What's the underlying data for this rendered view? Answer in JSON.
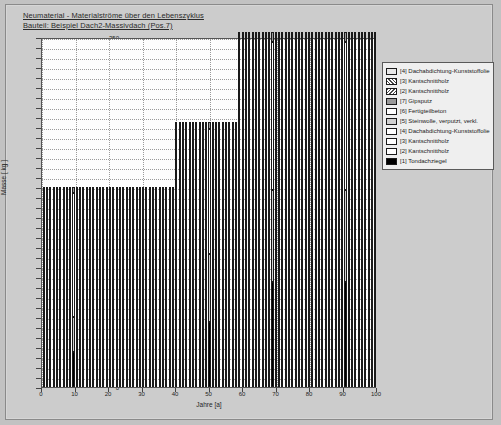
{
  "header": {
    "line1": "Neumaterial - Materialströme über den Lebenszyklus",
    "line2": "Bauteil: Beispiel Dach2-Massivdach (Pos.7)"
  },
  "chart_data": {
    "type": "bar",
    "title": "Neumaterial - Materialströme über den Lebenszyklus",
    "subtitle": "Bauteil: Beispiel Dach2-Massivdach (Pos.7)",
    "xlabel": "Jahre [a]",
    "ylabel": "Masse [ kg ]",
    "xlim": [
      0,
      100
    ],
    "ylim": [
      0,
      350
    ],
    "ytick_step": 10,
    "xtick_step": 10,
    "grid": true,
    "legend_position": "top-right-outside",
    "ytick_labels": [
      "0",
      "10",
      "20",
      "30",
      "40",
      "50",
      "60",
      "70",
      "80",
      "90",
      "100",
      "110",
      "120",
      "130",
      "140",
      "150",
      "160",
      "170",
      "180",
      "190",
      "200",
      "210",
      "220",
      "230",
      "240",
      "250",
      "260",
      "270",
      "280",
      "290",
      "300",
      "310",
      "320",
      "330",
      "340",
      "350"
    ],
    "xtick_labels": [
      "0",
      "10",
      "20",
      "30",
      "40",
      "50",
      "60",
      "70",
      "80",
      "90",
      "100"
    ],
    "legend": [
      {
        "label": "[4] Dachabdichtung-Kunststoffolie",
        "fill": "dots"
      },
      {
        "label": "[3] Kantschnittholz",
        "fill": "hatch-a"
      },
      {
        "label": "[2] Kantschnittholz",
        "fill": "hatch-b"
      },
      {
        "label": "[7] Gipsputz",
        "fill": "mdgray"
      },
      {
        "label": "[6] Fertigteilbeton",
        "fill": "white"
      },
      {
        "label": "[5] Steinwolle, verputzt, verkl.",
        "fill": "ltgray"
      },
      {
        "label": "[4] Dachabdichtung-Kunststoffolie",
        "fill": "white"
      },
      {
        "label": "[3] Kantschnittholz",
        "fill": "white"
      },
      {
        "label": "[2] Kantschnittholz",
        "fill": "white"
      },
      {
        "label": "[1] Tondachziegel",
        "fill": "black"
      }
    ],
    "series": [
      {
        "name": "[1] Tondachziegel",
        "fill": "black"
      },
      {
        "name": "[5] Steinwolle, verputzt, verkl.",
        "fill": "ltgray"
      },
      {
        "name": "[6] Fertigteilbeton",
        "fill": "white"
      },
      {
        "name": "[7] Gipsputz",
        "fill": "mdgray"
      }
    ],
    "groups": [
      {
        "name": "Phase 1 (Jahre 0-39)",
        "years_from": 0,
        "years_to": 39,
        "total": 200,
        "stack": [
          {
            "fill": "black",
            "from": 0,
            "to": 35
          },
          {
            "fill": "ltgray",
            "from": 35,
            "to": 70
          },
          {
            "fill": "white",
            "from": 70,
            "to": 194
          },
          {
            "fill": "mdgray",
            "from": 194,
            "to": 200
          }
        ]
      },
      {
        "name": "Phase 2 (Jahre 40-58)",
        "years_from": 40,
        "years_to": 58,
        "total": 265,
        "stack": [
          {
            "fill": "black",
            "from": 0,
            "to": 65
          },
          {
            "fill": "ltgray",
            "from": 65,
            "to": 133
          },
          {
            "fill": "white",
            "from": 133,
            "to": 258
          },
          {
            "fill": "mdgray",
            "from": 258,
            "to": 265
          }
        ]
      },
      {
        "name": "Phase 3 (Jahre 59-100)",
        "years_from": 59,
        "years_to": 100,
        "total": 355,
        "stack": [
          {
            "fill": "black",
            "from": 0,
            "to": 105
          },
          {
            "fill": "ltgray",
            "from": 105,
            "to": 197
          },
          {
            "fill": "white",
            "from": 197,
            "to": 345
          },
          {
            "fill": "mdgray",
            "from": 345,
            "to": 355
          }
        ]
      }
    ],
    "bars": [
      {
        "year": 0,
        "total": 200
      },
      {
        "year": 1,
        "total": 200
      },
      {
        "year": 2,
        "total": 200
      },
      {
        "year": 3,
        "total": 200
      },
      {
        "year": 4,
        "total": 200
      },
      {
        "year": 5,
        "total": 200
      },
      {
        "year": 6,
        "total": 200
      },
      {
        "year": 7,
        "total": 200
      },
      {
        "year": 8,
        "total": 200
      },
      {
        "year": 9,
        "total": 200
      },
      {
        "year": 10,
        "total": 200
      },
      {
        "year": 11,
        "total": 200
      },
      {
        "year": 12,
        "total": 200
      },
      {
        "year": 13,
        "total": 200
      },
      {
        "year": 14,
        "total": 200
      },
      {
        "year": 15,
        "total": 200
      },
      {
        "year": 16,
        "total": 200
      },
      {
        "year": 17,
        "total": 200
      },
      {
        "year": 18,
        "total": 200
      },
      {
        "year": 19,
        "total": 200
      },
      {
        "year": 20,
        "total": 200
      },
      {
        "year": 21,
        "total": 200
      },
      {
        "year": 22,
        "total": 200
      },
      {
        "year": 23,
        "total": 200
      },
      {
        "year": 24,
        "total": 200
      },
      {
        "year": 25,
        "total": 200
      },
      {
        "year": 26,
        "total": 200
      },
      {
        "year": 27,
        "total": 200
      },
      {
        "year": 28,
        "total": 200
      },
      {
        "year": 29,
        "total": 200
      },
      {
        "year": 30,
        "total": 200
      },
      {
        "year": 31,
        "total": 200
      },
      {
        "year": 32,
        "total": 200
      },
      {
        "year": 33,
        "total": 200
      },
      {
        "year": 34,
        "total": 200
      },
      {
        "year": 35,
        "total": 200
      },
      {
        "year": 36,
        "total": 200
      },
      {
        "year": 37,
        "total": 200
      },
      {
        "year": 38,
        "total": 200
      },
      {
        "year": 39,
        "total": 200
      },
      {
        "year": 40,
        "total": 265
      },
      {
        "year": 41,
        "total": 265
      },
      {
        "year": 42,
        "total": 265
      },
      {
        "year": 43,
        "total": 265
      },
      {
        "year": 44,
        "total": 265
      },
      {
        "year": 45,
        "total": 265
      },
      {
        "year": 46,
        "total": 265
      },
      {
        "year": 47,
        "total": 265
      },
      {
        "year": 48,
        "total": 265
      },
      {
        "year": 49,
        "total": 265
      },
      {
        "year": 50,
        "total": 265
      },
      {
        "year": 51,
        "total": 265
      },
      {
        "year": 52,
        "total": 265
      },
      {
        "year": 53,
        "total": 265
      },
      {
        "year": 54,
        "total": 265
      },
      {
        "year": 55,
        "total": 265
      },
      {
        "year": 56,
        "total": 265
      },
      {
        "year": 57,
        "total": 265
      },
      {
        "year": 58,
        "total": 265
      },
      {
        "year": 59,
        "total": 355
      },
      {
        "year": 60,
        "total": 355
      },
      {
        "year": 61,
        "total": 355
      },
      {
        "year": 62,
        "total": 355
      },
      {
        "year": 63,
        "total": 355
      },
      {
        "year": 64,
        "total": 355
      },
      {
        "year": 65,
        "total": 355
      },
      {
        "year": 66,
        "total": 355
      },
      {
        "year": 67,
        "total": 355
      },
      {
        "year": 68,
        "total": 355
      },
      {
        "year": 69,
        "total": 355
      },
      {
        "year": 70,
        "total": 355
      },
      {
        "year": 71,
        "total": 355
      },
      {
        "year": 72,
        "total": 355
      },
      {
        "year": 73,
        "total": 355
      },
      {
        "year": 74,
        "total": 355
      },
      {
        "year": 75,
        "total": 355
      },
      {
        "year": 76,
        "total": 355
      },
      {
        "year": 77,
        "total": 355
      },
      {
        "year": 78,
        "total": 355
      },
      {
        "year": 79,
        "total": 355
      },
      {
        "year": 80,
        "total": 355
      },
      {
        "year": 81,
        "total": 355
      },
      {
        "year": 82,
        "total": 355
      },
      {
        "year": 83,
        "total": 355
      },
      {
        "year": 84,
        "total": 355
      },
      {
        "year": 85,
        "total": 355
      },
      {
        "year": 86,
        "total": 355
      },
      {
        "year": 87,
        "total": 355
      },
      {
        "year": 88,
        "total": 355
      },
      {
        "year": 89,
        "total": 355
      },
      {
        "year": 90,
        "total": 355
      },
      {
        "year": 91,
        "total": 355
      },
      {
        "year": 92,
        "total": 355
      },
      {
        "year": 93,
        "total": 355
      },
      {
        "year": 94,
        "total": 355
      },
      {
        "year": 95,
        "total": 355
      },
      {
        "year": 96,
        "total": 355
      },
      {
        "year": 97,
        "total": 355
      },
      {
        "year": 98,
        "total": 355
      },
      {
        "year": 99,
        "total": 355
      },
      {
        "year": 100,
        "total": 355
      }
    ]
  }
}
